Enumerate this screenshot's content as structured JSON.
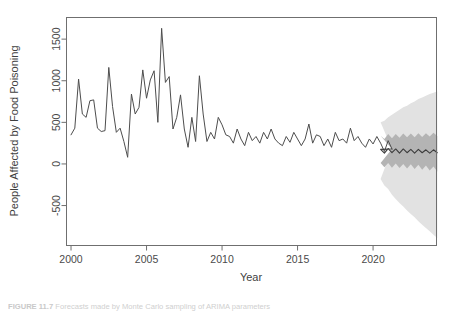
{
  "figure": {
    "caption_label": "FIGURE 11.7",
    "caption_text": "Forecasts made by Monte Carlo sampling of ARIMA parameters"
  },
  "chart_data": {
    "type": "line",
    "title": "",
    "xlabel": "Year",
    "ylabel": "People Affected by Food Poisoning",
    "xlim": [
      1999.7,
      2024.2
    ],
    "ylim": [
      -980,
      1760
    ],
    "xticks": [
      2000,
      2005,
      2010,
      2015,
      2020
    ],
    "xticklabels": [
      "2000",
      "2005",
      "2010",
      "2015",
      "2020"
    ],
    "yticks": [
      -500,
      0,
      500,
      1000,
      1500
    ],
    "yticklabels": [
      "-500",
      "0",
      "500",
      "1000",
      "1500"
    ],
    "grid": false,
    "legend": null,
    "line_color": "#4d4d4d",
    "interval_80_color": "#b4b4b4",
    "interval_95_color": "#e2e2e2",
    "series": [
      {
        "name": "Observed people affected by food poisoning",
        "x_start": 2000.0,
        "x_step": 0.25,
        "values": [
          350,
          430,
          1020,
          600,
          560,
          760,
          770,
          430,
          390,
          400,
          1160,
          690,
          380,
          430,
          270,
          80,
          840,
          600,
          680,
          1130,
          790,
          1010,
          1120,
          500,
          1630,
          980,
          1050,
          420,
          560,
          830,
          420,
          200,
          560,
          270,
          1060,
          600,
          270,
          380,
          300,
          560,
          470,
          350,
          330,
          250,
          420,
          300,
          220,
          380,
          280,
          330,
          250,
          380,
          300,
          420,
          300,
          250,
          220,
          330,
          260,
          380,
          300,
          220,
          300,
          480,
          250,
          350,
          330,
          220,
          300,
          200,
          380,
          280,
          300,
          250,
          430,
          280,
          330,
          250,
          200,
          300,
          240,
          330,
          250,
          150,
          280,
          180
        ]
      }
    ],
    "forecast": {
      "name": "Mean forecast",
      "x_start": 2020.5,
      "x_step": 0.25,
      "mean": [
        175,
        130,
        185,
        135,
        180,
        130,
        180,
        135,
        175,
        130,
        175,
        135,
        170,
        130,
        170,
        135
      ],
      "lower_80": [
        10,
        -40,
        10,
        -45,
        5,
        -50,
        0,
        -55,
        -5,
        -60,
        -10,
        -70,
        -20,
        -80,
        -30,
        -90
      ],
      "upper_80": [
        340,
        300,
        360,
        310,
        360,
        315,
        365,
        320,
        365,
        320,
        370,
        325,
        370,
        330,
        375,
        335
      ],
      "lower_95": [
        -180,
        -260,
        -300,
        -370,
        -420,
        -470,
        -510,
        -560,
        -600,
        -640,
        -690,
        -730,
        -770,
        -810,
        -850,
        -890
      ],
      "upper_95": [
        500,
        520,
        560,
        590,
        620,
        650,
        680,
        700,
        730,
        750,
        780,
        800,
        820,
        840,
        855,
        870
      ]
    }
  }
}
